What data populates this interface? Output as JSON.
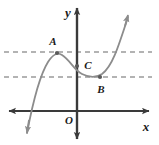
{
  "figure": {
    "type": "cubic-function-graph",
    "background_color": "#ffffff",
    "axis_color": "#3a3a3a",
    "curve_color": "#8c8c8c",
    "dashed_color": "#9a9a9a",
    "label_color": "#1a1a1a",
    "axes": {
      "x_axis_label": "x",
      "y_axis_label": "y",
      "origin_label": "O",
      "x_axis_y_px": 111,
      "y_axis_x_px": 77,
      "x_axis_arrows": "both",
      "y_axis_arrows": "both"
    },
    "points": [
      {
        "id": "A",
        "label": "A",
        "role": "local-maximum",
        "x_px": 57,
        "y_px": 53,
        "label_x_px": 56,
        "label_y_px": 45
      },
      {
        "id": "C",
        "label": "C",
        "role": "y-intercept-inflection",
        "x_px": 77,
        "y_px": 65,
        "label_x_px": 85,
        "label_y_px": 68
      },
      {
        "id": "B",
        "label": "B",
        "role": "local-minimum",
        "x_px": 100,
        "y_px": 77,
        "label_x_px": 99,
        "label_y_px": 92
      }
    ],
    "dashed_lines": [
      {
        "id": "upper",
        "label": "horizontal-dashed-through-A",
        "y_px": 52,
        "x_start_px": 4,
        "x_end_px": 152
      },
      {
        "id": "lower",
        "label": "horizontal-dashed-through-B",
        "y_px": 77,
        "x_start_px": 4,
        "x_end_px": 152
      }
    ],
    "curve": {
      "description": "cubic curve rising from lower-left arrow, local maximum at A, decreasing through C, local minimum at B, rising to upper-right arrow",
      "path": "M 27,133 C 31,112 38,78 48,62 C 53,54 57,52 62,55 C 70,60 74,70 82,74 C 90,78 96,78 102,74 C 112,67 118,48 128,17",
      "left_arrow": "down",
      "right_arrow": "up"
    }
  }
}
